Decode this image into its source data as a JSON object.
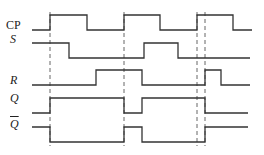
{
  "diagram": {
    "type": "timing-diagram",
    "signals": [
      {
        "id": "cp",
        "label": "CP",
        "italic": false,
        "overline": false,
        "label_y": 25,
        "points": "32,30 50,30 50,15 87,15 87,30 124,30 124,15 160,15 160,30 197,30 197,15 233,15 233,30 252,30"
      },
      {
        "id": "s",
        "label": "S",
        "italic": true,
        "overline": false,
        "label_y": 39,
        "points": "32,43 69,43 69,58 144,58 144,43 178,43 178,58 250,58"
      },
      {
        "id": "r",
        "label": "R",
        "italic": true,
        "overline": false,
        "label_y": 80,
        "points": "32,85 96,85 96,70 142,70 142,85 205,85 205,70 221,70 221,85 250,85"
      },
      {
        "id": "q",
        "label": "Q",
        "italic": true,
        "overline": false,
        "label_y": 98,
        "points": "32,113 50,113 50,98 124,98 124,113 142,113 142,98 205,98 205,113 248,113"
      },
      {
        "id": "qbar",
        "label": "Q",
        "italic": true,
        "overline": true,
        "label_y": 124,
        "points": "32,127 50,127 50,142 124,142 124,127 142,127 142,142 205,142 205,127 248,127"
      }
    ],
    "dashed_markers_x": [
      50,
      124,
      197,
      205
    ],
    "dashed_range": [
      12,
      146
    ]
  }
}
